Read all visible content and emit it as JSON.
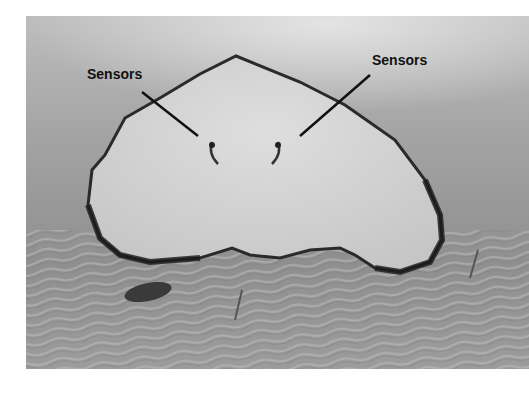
{
  "figure": {
    "colors": {
      "water_light": "#cfcfcf",
      "water_mid": "#9a9a9a",
      "body": "#d2d2d2",
      "edge": "#2a2a2a",
      "sand": "#a8a8a8"
    },
    "annotations": [
      {
        "label": "Sensors",
        "x": 87,
        "y": 79,
        "line": [
          142,
          92,
          198,
          136
        ]
      },
      {
        "label": "Sensors",
        "x": 372,
        "y": 65,
        "line": [
          370,
          75,
          300,
          136
        ]
      }
    ]
  }
}
